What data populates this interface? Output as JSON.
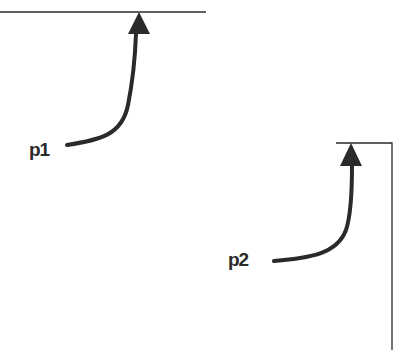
{
  "diagram": {
    "colors": {
      "line": "#2a2a2a",
      "background": "#ffffff"
    },
    "boundaries": [
      {
        "name": "top-horizontal-line",
        "type": "line"
      },
      {
        "name": "corner-line",
        "type": "corner"
      }
    ],
    "points": [
      {
        "id": "p1",
        "label": "p1"
      },
      {
        "id": "p2",
        "label": "p2"
      }
    ]
  }
}
